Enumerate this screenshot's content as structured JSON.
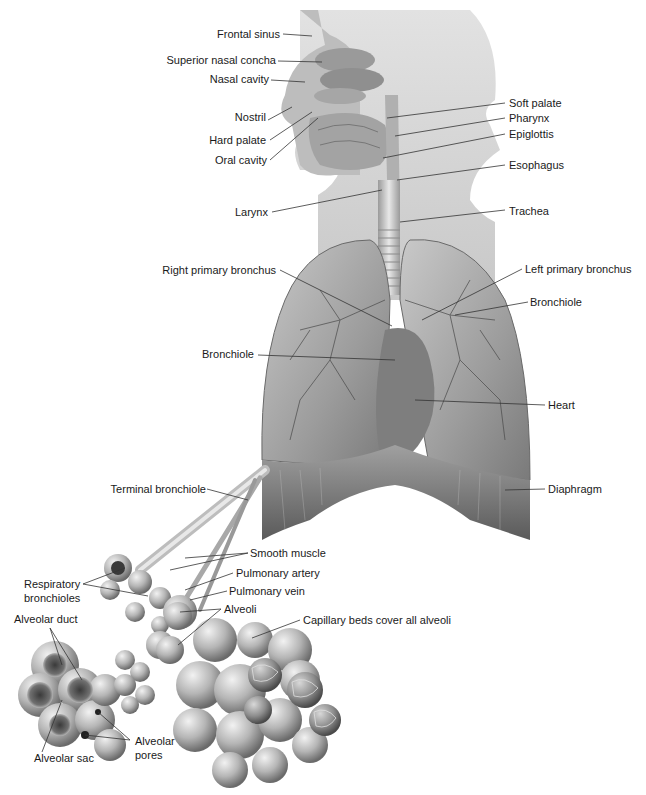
{
  "figure": {
    "colors": {
      "background": "#ffffff",
      "silhouette": "#cfcfcf",
      "lung": "#a8a8a8",
      "lung_dark": "#6e6e6e",
      "diaphragm": "#8a8a8a",
      "alveoli": "#b8b8b8",
      "leader_line": "#333333",
      "label_text": "#1a1a1a"
    }
  },
  "labels": {
    "head": {
      "frontal_sinus": "Frontal sinus",
      "superior_nasal_concha": "Superior nasal concha",
      "nasal_cavity": "Nasal cavity",
      "nostril": "Nostril",
      "hard_palate": "Hard palate",
      "oral_cavity": "Oral cavity",
      "larynx": "Larynx"
    },
    "throat_right": {
      "soft_palate": "Soft palate",
      "pharynx": "Pharynx",
      "epiglottis": "Epiglottis",
      "esophagus": "Esophagus",
      "trachea": "Trachea"
    },
    "thorax": {
      "right_primary_bronchus": "Right primary bronchus",
      "left_primary_bronchus": "Left primary bronchus",
      "bronchiole_right": "Bronchiole",
      "bronchiole_left": "Bronchiole",
      "heart": "Heart",
      "diaphragm": "Diaphragm",
      "terminal_bronchiole": "Terminal bronchiole"
    },
    "alveolar": {
      "smooth_muscle": "Smooth muscle",
      "pulmonary_artery": "Pulmonary artery",
      "pulmonary_vein": "Pulmonary vein",
      "respiratory_bronchioles_1": "Respiratory",
      "respiratory_bronchioles_2": "bronchioles",
      "alveoli": "Alveoli",
      "alveolar_duct": "Alveolar duct",
      "capillary_beds": "Capillary beds cover all alveoli",
      "alveolar_sac": "Alveolar sac",
      "alveolar_pores_1": "Alveolar",
      "alveolar_pores_2": "pores"
    }
  }
}
